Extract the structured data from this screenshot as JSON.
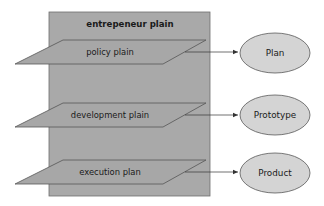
{
  "diagram": {
    "container": {
      "label": "entrepeneur plain",
      "fill": "#a9a9a9",
      "stroke": "#6e6e6e"
    },
    "planes": [
      {
        "label": "policy plain",
        "y_top": 40,
        "y_bottom": 64
      },
      {
        "label": "development plain",
        "y_top": 103,
        "y_bottom": 127
      },
      {
        "label": "execution plan",
        "y_top": 160,
        "y_bottom": 184
      }
    ],
    "outputs": [
      {
        "label": "Plan",
        "cy": 53
      },
      {
        "label": "Prototype",
        "cy": 115
      },
      {
        "label": "Product",
        "cy": 173
      }
    ],
    "colors": {
      "plane_fill": "#a7a7a7",
      "plane_stroke": "#555555",
      "ellipse_fill": "#d4d4d4",
      "ellipse_stroke": "#5a5a5a",
      "arrow": "#333333"
    }
  }
}
